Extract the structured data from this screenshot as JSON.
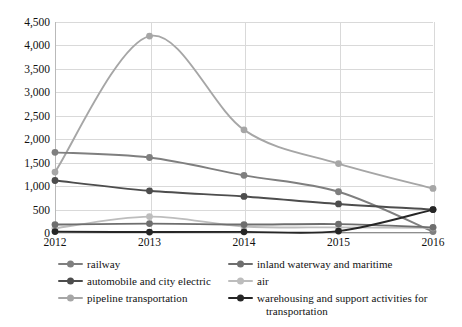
{
  "chart_data": {
    "type": "line",
    "title": "",
    "xlabel": "",
    "ylabel": "",
    "categories": [
      "2012",
      "2013",
      "2014",
      "2015",
      "2016"
    ],
    "x": [
      2012,
      2013,
      2014,
      2015,
      2016
    ],
    "ylim": [
      0,
      4500
    ],
    "ytick_step": 500,
    "yticks": [
      "0",
      "500",
      "1,000",
      "1,500",
      "2,000",
      "2,500",
      "3,000",
      "3,500",
      "4,000",
      "4,500"
    ],
    "ytick_values": [
      0,
      500,
      1000,
      1500,
      2000,
      2500,
      3000,
      3500,
      4000,
      4500
    ],
    "grid": true,
    "legend_position": "bottom",
    "smoothing": "spline",
    "series": [
      {
        "name": "railway",
        "color": "#7f7f7f",
        "values": [
          1720,
          1610,
          1230,
          880,
          30
        ]
      },
      {
        "name": "inland waterway and maritime",
        "color": "#6e6e6e",
        "values": [
          180,
          200,
          180,
          190,
          120
        ]
      },
      {
        "name": "automobile and city electric",
        "color": "#4d4d4d",
        "values": [
          1120,
          900,
          780,
          620,
          500
        ]
      },
      {
        "name": "air",
        "color": "#bdbdbd",
        "values": [
          100,
          350,
          140,
          120,
          110
        ]
      },
      {
        "name": "pipeline transportation",
        "color": "#a6a6a6",
        "values": [
          1300,
          4200,
          2200,
          1480,
          950
        ]
      },
      {
        "name": "warehousing and support activities for transportation",
        "color": "#262626",
        "values": [
          30,
          20,
          25,
          40,
          500
        ]
      }
    ],
    "legend": [
      {
        "label": "railway",
        "color": "#7f7f7f",
        "continuation": ""
      },
      {
        "label": "inland waterway and maritime",
        "color": "#6e6e6e",
        "continuation": ""
      },
      {
        "label": "automobile and city electric",
        "color": "#4d4d4d",
        "continuation": ""
      },
      {
        "label": "air",
        "color": "#bdbdbd",
        "continuation": ""
      },
      {
        "label": "pipeline transportation",
        "color": "#a6a6a6",
        "continuation": ""
      },
      {
        "label": "warehousing and support activities for",
        "color": "#262626",
        "continuation": "transportation"
      }
    ]
  }
}
